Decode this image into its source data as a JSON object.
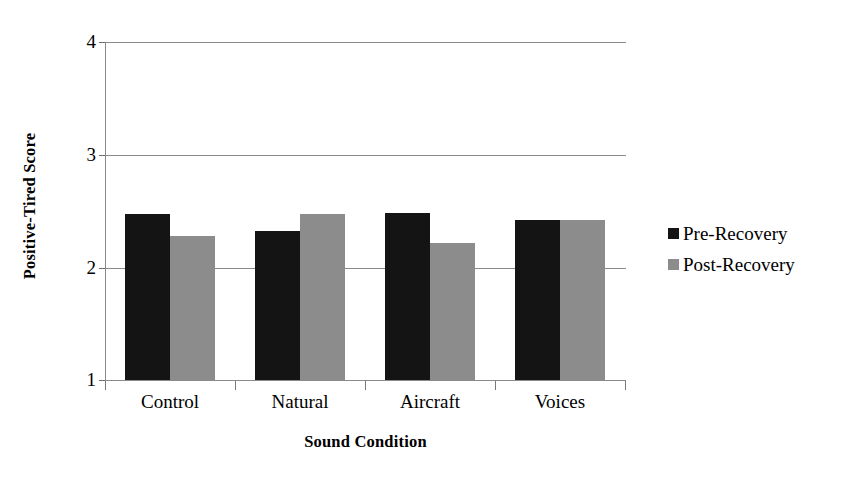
{
  "chart_data": {
    "type": "bar",
    "title": "",
    "xlabel": "Sound Condition",
    "ylabel": "Positive-Tired Score",
    "categories": [
      "Control",
      "Natural",
      "Aircraft",
      "Voices"
    ],
    "series": [
      {
        "name": "Pre-Recovery",
        "color": "#141414",
        "values": [
          2.47,
          2.32,
          2.48,
          2.42
        ]
      },
      {
        "name": "Post-Recovery",
        "color": "#8c8c8c",
        "values": [
          2.28,
          2.47,
          2.22,
          2.42
        ]
      }
    ],
    "ylim": [
      1,
      4
    ],
    "yticks": [
      1,
      2,
      3,
      4
    ],
    "ytick_labels": [
      "1",
      "2",
      "3",
      "4"
    ],
    "grid": true,
    "legend_position": "right",
    "legend_entries": [
      "Pre-Recovery",
      "Post-Recovery"
    ]
  },
  "axis": {
    "y_title": "Positive-Tired Score",
    "x_title": "Sound Condition",
    "y_labels": [
      "4",
      "3",
      "2",
      "1"
    ]
  },
  "legend": {
    "entries": [
      {
        "label": "Pre-Recovery"
      },
      {
        "label": "Post-Recovery"
      }
    ]
  }
}
